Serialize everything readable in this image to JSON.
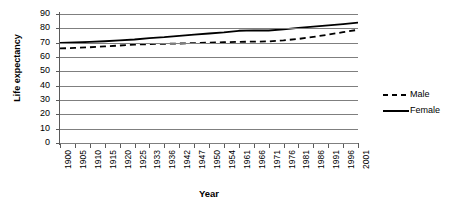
{
  "chart_data": {
    "type": "line",
    "title": "",
    "xlabel": "Year",
    "ylabel": "Life expectancy",
    "ylim": [
      0,
      90
    ],
    "y_ticks": [
      90,
      80,
      70,
      60,
      50,
      40,
      30,
      20,
      10,
      0
    ],
    "grid": true,
    "legend_position": "right",
    "categories": [
      "1900",
      "1905",
      "1910",
      "1915",
      "1920",
      "1925",
      "1933",
      "1936",
      "1942",
      "1947",
      "1950",
      "1954",
      "1961",
      "1966",
      "1971",
      "1976",
      "1981",
      "1986",
      "1991",
      "1996",
      "2001"
    ],
    "series": [
      {
        "name": "Male",
        "style": "dashed",
        "color": "#000000",
        "values": [
          66.0,
          66.3,
          66.8,
          67.4,
          68.0,
          68.6,
          69.0,
          69.2,
          69.4,
          69.7,
          70.0,
          70.3,
          70.6,
          70.7,
          70.9,
          71.6,
          72.6,
          74.0,
          75.6,
          77.3,
          79.0
        ]
      },
      {
        "name": "Female",
        "style": "solid",
        "color": "#000000",
        "values": [
          69.8,
          70.1,
          70.5,
          71.0,
          71.6,
          72.2,
          73.2,
          73.8,
          74.7,
          75.6,
          76.4,
          77.2,
          78.3,
          78.6,
          78.5,
          79.3,
          80.3,
          81.2,
          82.1,
          83.0,
          84.0
        ]
      }
    ],
    "legend": [
      {
        "label": "Male",
        "style": "dashed"
      },
      {
        "label": "Female",
        "style": "solid"
      }
    ]
  }
}
